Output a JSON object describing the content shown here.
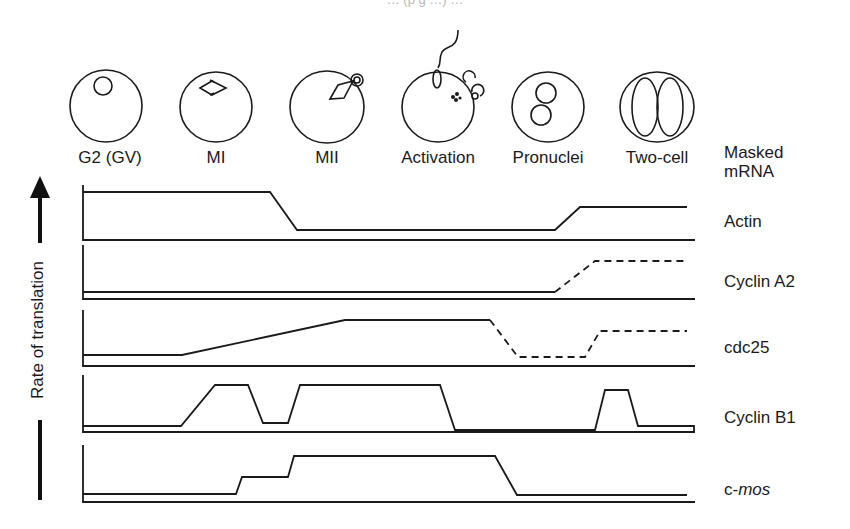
{
  "caption_fragment": "… (p g …) …",
  "stages": [
    {
      "id": "g2",
      "label": "G2 (GV)",
      "cx": 110
    },
    {
      "id": "mi",
      "label": "MI",
      "cx": 216
    },
    {
      "id": "mii",
      "label": "MII",
      "cx": 327
    },
    {
      "id": "activation",
      "label": "Activation",
      "cx": 438
    },
    {
      "id": "pronuclei",
      "label": "Pronuclei",
      "cx": 548
    },
    {
      "id": "two-cell",
      "label": "Two-cell",
      "cx": 657
    }
  ],
  "right_header": {
    "line1": "Masked",
    "line2": "mRNA"
  },
  "y_axis_label": "Rate of translation",
  "rows": [
    {
      "id": "actin",
      "label": "Actin",
      "italic": ""
    },
    {
      "id": "cyclin-a2",
      "label": "Cyclin A2",
      "italic": ""
    },
    {
      "id": "cdc25",
      "label": "cdc25",
      "italic": ""
    },
    {
      "id": "cyclin-b1",
      "label": "Cyclin B1",
      "italic": ""
    },
    {
      "id": "c-mos",
      "label": "c-",
      "italic": "mos"
    }
  ],
  "chart_data": {
    "type": "line",
    "xlabel": "Developmental stage",
    "ylabel": "Rate of translation",
    "categories": [
      "G2 (GV)",
      "MI",
      "MII",
      "Activation",
      "Pronuclei",
      "Two-cell"
    ],
    "note": "Relative levels (0 = low, 1 = high); dashed segments indicate inferred/uncertain translation",
    "series": [
      {
        "name": "Actin",
        "values": [
          1.0,
          1.0,
          0.2,
          0.2,
          0.2,
          0.65
        ],
        "dashed_from": null
      },
      {
        "name": "Cyclin A2",
        "values": [
          0.1,
          0.1,
          0.1,
          0.1,
          0.1,
          0.75
        ],
        "dashed_from": "Pronuclei"
      },
      {
        "name": "cdc25",
        "values": [
          0.2,
          0.45,
          0.8,
          0.8,
          0.15,
          0.6
        ],
        "dashed_from": "Activation"
      },
      {
        "name": "Cyclin B1",
        "values": [
          0.1,
          0.85,
          0.85,
          0.85,
          0.05,
          0.75
        ],
        "dashed_from": null
      },
      {
        "name": "c-mos",
        "values": [
          0.1,
          0.1,
          0.8,
          0.8,
          0.1,
          0.1
        ],
        "dashed_from": null
      }
    ],
    "legend": "labels at right of each row",
    "grid": false
  },
  "traces": {
    "actin": {
      "top": 185,
      "base": 240,
      "solid": "83,192 270,192 297,230 555,230 580,207 687,207",
      "dashed": ""
    },
    "cyclin-a2": {
      "top": 245,
      "base": 299,
      "solid": "83,292 555,292",
      "dashed": "555,292 595,261 687,261"
    },
    "cdc25": {
      "top": 310,
      "base": 366,
      "solid": "83,355 182,355 345,320 490,320",
      "dashed": "490,320 518,357 585,357 600,331 687,331"
    },
    "cyclin-b1": {
      "top": 375,
      "base": 432,
      "solid": "83,426 181,426 215,385 248,385 263,423 288,423 300,385 440,385 455,430 595,430 605,390 628,390 638,426 694,426 694,432",
      "dashed": ""
    },
    "c-mos": {
      "top": 445,
      "base": 502,
      "solid": "83,494 236,494 242,477 288,477 294,456 495,456 517,495 687,495",
      "dashed": ""
    }
  }
}
